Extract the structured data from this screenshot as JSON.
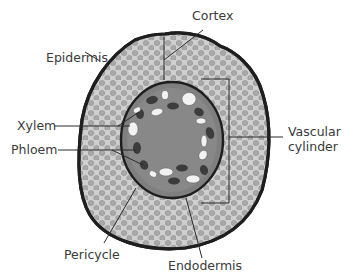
{
  "diagram": {
    "labels": {
      "cortex": "Cortex",
      "epidermis": "Epidermis",
      "xylem": "Xylem",
      "phloem": "Phloem",
      "vascular_line1": "Vascular",
      "vascular_line2": "cylinder",
      "pericycle": "Pericycle",
      "endodermis": "Endodermis"
    },
    "colors": {
      "outline": "#1e1e1e",
      "cortex_fill": "#cfcfcf",
      "cortex_cells": "#a8a8a8",
      "stele_fill": "#7f7f7f",
      "phloem": "#3c3c3c",
      "xylem": "#f2f2f2",
      "text": "#3a3a3a"
    }
  }
}
